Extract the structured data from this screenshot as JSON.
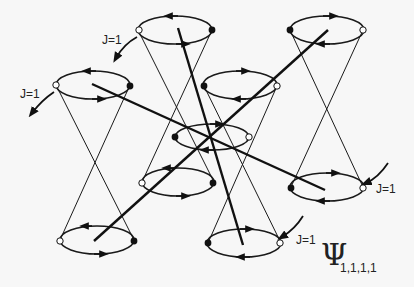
{
  "diagram": {
    "title_symbol": "Ψ",
    "title_subscript": "1,1,1,1",
    "labels": [
      {
        "text": "J=1",
        "x": 102,
        "y": 44
      },
      {
        "text": "J=1",
        "x": 20,
        "y": 98
      },
      {
        "text": "J=1",
        "x": 376,
        "y": 193
      },
      {
        "text": "J=1",
        "x": 296,
        "y": 244
      }
    ],
    "cones": [
      {
        "top": {
          "cx": 93,
          "cy": 85,
          "rx": 37,
          "ry": 14
        },
        "bottom": {
          "cx": 97,
          "cy": 240,
          "rx": 37,
          "ry": 14
        }
      },
      {
        "top": {
          "cx": 175,
          "cy": 30,
          "rx": 37,
          "ry": 14
        },
        "bottom": {
          "cx": 178,
          "cy": 182,
          "rx": 36,
          "ry": 14
        }
      },
      {
        "top": {
          "cx": 240,
          "cy": 85,
          "rx": 37,
          "ry": 14
        },
        "bottom": {
          "cx": 244,
          "cy": 243,
          "rx": 37,
          "ry": 14
        }
      },
      {
        "top": {
          "cx": 327,
          "cy": 30,
          "rx": 37,
          "ry": 14
        },
        "bottom": {
          "cx": 327,
          "cy": 187,
          "rx": 37,
          "ry": 14
        }
      }
    ],
    "center_ring": {
      "cx": 212,
      "cy": 137,
      "rx": 37,
      "ry": 13
    },
    "axes": [
      {
        "x1": 92,
        "y1": 84,
        "x2": 325,
        "y2": 190
      },
      {
        "x1": 178,
        "y1": 28,
        "x2": 243,
        "y2": 245
      },
      {
        "x1": 328,
        "y1": 30,
        "x2": 94,
        "y2": 241
      }
    ]
  }
}
